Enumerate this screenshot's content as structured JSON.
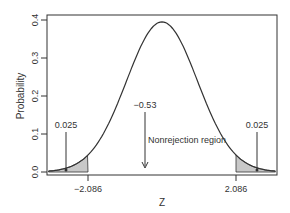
{
  "chart_data": {
    "type": "line",
    "title": "",
    "xlabel": "Z",
    "ylabel": "Probability",
    "distribution": "t / normal density curve",
    "xlim": [
      -3.2,
      3.2
    ],
    "ylim": [
      0.0,
      0.4
    ],
    "yticks": [
      "0.0",
      "0.1",
      "0.2",
      "0.3",
      "0.4"
    ],
    "xticks": [
      "-2.086",
      "2.086"
    ],
    "critical_values": [
      -2.086,
      2.086
    ],
    "peak": {
      "x": 0,
      "y": 0.395
    },
    "shaded_regions": [
      {
        "name": "left rejection region",
        "from": -3.2,
        "to": -2.086,
        "area_label": "0.025"
      },
      {
        "name": "right rejection region",
        "from": 2.086,
        "to": 3.2,
        "area_label": "0.025"
      }
    ],
    "annotations": [
      {
        "text": "0.025",
        "target": "left tail",
        "x": -2.7
      },
      {
        "text": "0.025",
        "target": "right tail",
        "x": 2.7
      },
      {
        "text": "-0.53",
        "target": "test statistic",
        "x": -0.53
      },
      {
        "text": "Nonrejection region",
        "target": "center"
      }
    ],
    "grid": false,
    "legend": null
  },
  "labels": {
    "ylabel": "Probability",
    "xlabel": "Z",
    "ytick_0": "0.0",
    "ytick_1": "0.1",
    "ytick_2": "0.2",
    "ytick_3": "0.3",
    "ytick_4": "0.4",
    "xtick_left": "−2.086",
    "xtick_right": "2.086",
    "left_tail": "0.025",
    "right_tail": "0.025",
    "test_stat": "−0.53",
    "nonrejection": "Nonrejection region"
  },
  "colors": {
    "curve": "#333333",
    "shade": "#c8c8c8",
    "axis": "#333333"
  }
}
